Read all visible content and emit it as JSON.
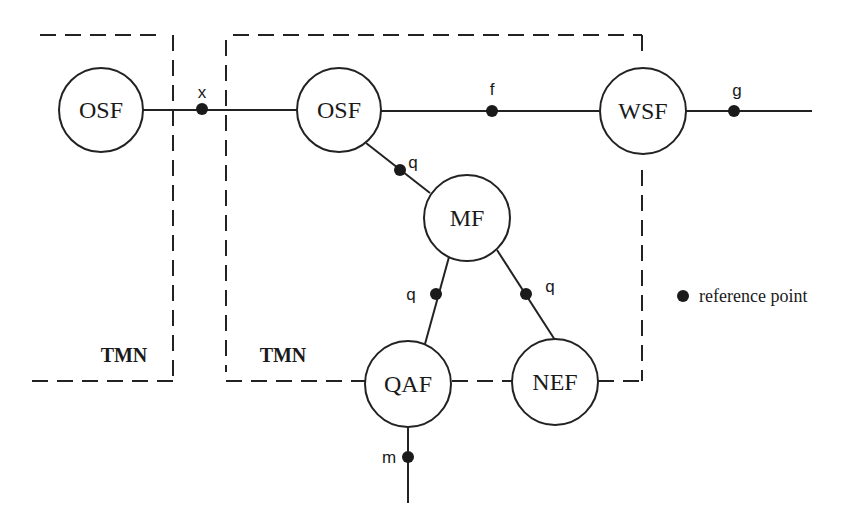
{
  "diagram": {
    "colors": {
      "ink": "#1a1a1a",
      "background": "#ffffff"
    },
    "domains": [
      {
        "id": "tmn-left",
        "label": "TMN"
      },
      {
        "id": "tmn-right",
        "label": "TMN"
      }
    ],
    "nodes": [
      {
        "id": "osf-left",
        "label": "OSF"
      },
      {
        "id": "osf-right",
        "label": "OSF"
      },
      {
        "id": "wsf",
        "label": "WSF"
      },
      {
        "id": "mf",
        "label": "MF"
      },
      {
        "id": "qaf",
        "label": "QAF"
      },
      {
        "id": "nef",
        "label": "NEF"
      }
    ],
    "reference_points": [
      {
        "id": "x",
        "label": "x",
        "between": [
          "osf-left",
          "osf-right"
        ]
      },
      {
        "id": "f",
        "label": "f",
        "between": [
          "osf-right",
          "wsf"
        ]
      },
      {
        "id": "g",
        "label": "g",
        "between": [
          "wsf",
          "external"
        ]
      },
      {
        "id": "q-osf-mf",
        "label": "q",
        "between": [
          "osf-right",
          "mf"
        ]
      },
      {
        "id": "q-mf-qaf",
        "label": "q",
        "between": [
          "mf",
          "qaf"
        ]
      },
      {
        "id": "q-mf-nef",
        "label": "q",
        "between": [
          "mf",
          "nef"
        ]
      },
      {
        "id": "m",
        "label": "m",
        "between": [
          "qaf",
          "external"
        ]
      }
    ],
    "legend": {
      "symbol": "filled-circle",
      "label": "reference point"
    }
  }
}
